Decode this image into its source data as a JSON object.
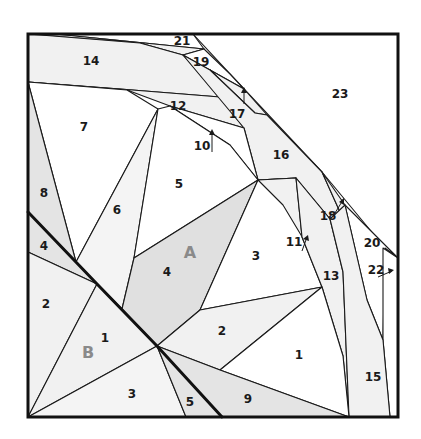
{
  "diagram": {
    "colors": {
      "light_fill": "#f1f1f1",
      "mid_fill": "#e0e0e0",
      "white_fill": "#ffffff",
      "section_label": "#8a8a8a",
      "line": "#1a1a1a"
    },
    "sections": [
      {
        "id": "A",
        "label": "A"
      },
      {
        "id": "B",
        "label": "B"
      }
    ],
    "labels": {
      "a1": "1",
      "a2": "2",
      "a3": "3",
      "a4": "4",
      "a5": "5",
      "a6": "6",
      "a7": "7",
      "a8": "8",
      "a9": "9",
      "a10": "10",
      "a11": "11",
      "a12": "12",
      "a13": "13",
      "a14": "14",
      "a15": "15",
      "a16": "16",
      "a17": "17",
      "a18": "18",
      "a19": "19",
      "a20": "20",
      "a21": "21",
      "a22": "22",
      "a23": "23",
      "b1": "1",
      "b2": "2",
      "b3": "3",
      "b4": "4",
      "b5": "5"
    }
  }
}
